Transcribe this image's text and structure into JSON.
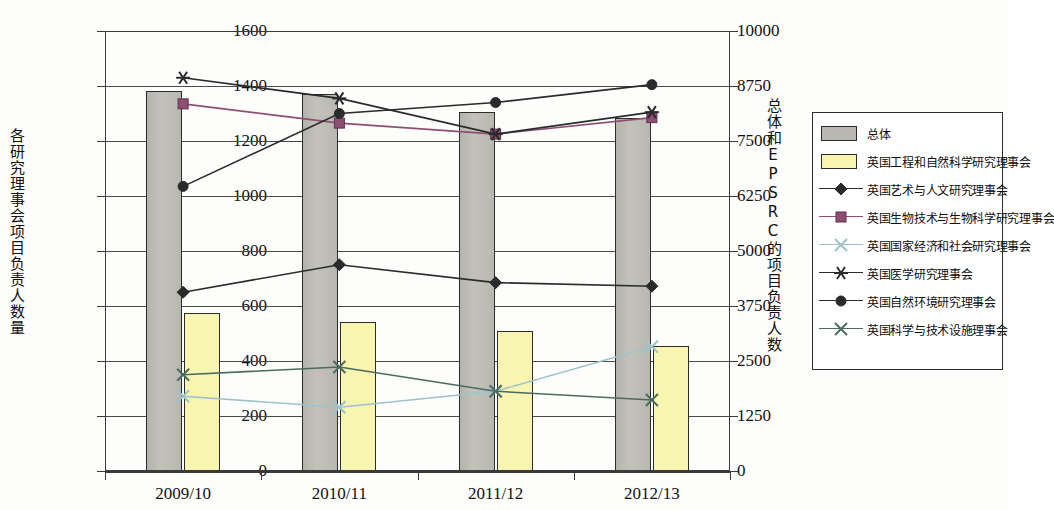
{
  "chart_data": {
    "type": "bar",
    "title": "",
    "categories": [
      "2009/10",
      "2010/11",
      "2011/12",
      "2012/13"
    ],
    "xlabel": "",
    "ylabel_left": "各研究理事会项目负责人数量",
    "ylabel_right": "总体和EPSRC的项目负责人数",
    "ylim_left": [
      0,
      1600
    ],
    "ylim_right": [
      0,
      10000
    ],
    "yticks_left": [
      0,
      200,
      400,
      600,
      800,
      1000,
      1200,
      1400,
      1600
    ],
    "yticks_right": [
      0,
      1250,
      2500,
      3750,
      5000,
      6250,
      7500,
      8750,
      10000
    ],
    "grid": true,
    "legend_position": "right",
    "series": [
      {
        "name": "总体",
        "kind": "bar",
        "axis": "right",
        "color": "#b8b8b0",
        "marker": "none",
        "values": [
          8630,
          8560,
          8150,
          8020
        ]
      },
      {
        "name": "英国工程和自然科学研究理事会",
        "kind": "bar",
        "axis": "right",
        "color": "#f7f5b0",
        "marker": "none",
        "values": [
          3580,
          3390,
          3190,
          2850
        ]
      },
      {
        "name": "英国艺术与人文研究理事会",
        "kind": "line",
        "axis": "left",
        "color": "#2b2b2b",
        "marker": "diamond",
        "values": [
          650,
          750,
          685,
          672
        ]
      },
      {
        "name": "英国生物技术与生物科学研究理事会",
        "kind": "line",
        "axis": "left",
        "color": "#8e4f72",
        "marker": "square",
        "values": [
          1335,
          1265,
          1225,
          1285
        ]
      },
      {
        "name": "英国国家经济和社会研究理事会",
        "kind": "line",
        "axis": "left",
        "color": "#9ec3cc",
        "marker": "x",
        "values": [
          272,
          232,
          290,
          452
        ]
      },
      {
        "name": "英国医学研究理事会",
        "kind": "line",
        "axis": "left",
        "color": "#2b2b2b",
        "marker": "asterisk",
        "values": [
          1430,
          1355,
          1225,
          1305
        ]
      },
      {
        "name": "英国自然环境研究理事会",
        "kind": "line",
        "axis": "left",
        "color": "#2b2b2b",
        "marker": "circle",
        "values": [
          1035,
          1300,
          1340,
          1405
        ]
      },
      {
        "name": "英国科学与技术设施理事会",
        "kind": "line",
        "axis": "left",
        "color": "#4b6b5e",
        "marker": "x",
        "values": [
          350,
          378,
          290,
          258
        ]
      }
    ]
  }
}
